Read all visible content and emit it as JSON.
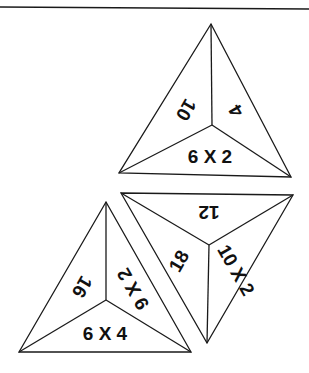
{
  "diagram": {
    "triangles": [
      {
        "id": "top",
        "orientation": "upright",
        "labels": {
          "left": "10",
          "right": "4",
          "bottom": "6 X 2"
        }
      },
      {
        "id": "bottom-right",
        "orientation": "inverted",
        "labels": {
          "top": "12",
          "left": "18",
          "right": "10 X 2"
        }
      },
      {
        "id": "bottom-left",
        "orientation": "upright",
        "labels": {
          "left": "16",
          "right": "9 X 2",
          "bottom": "6 X 4"
        }
      }
    ]
  }
}
